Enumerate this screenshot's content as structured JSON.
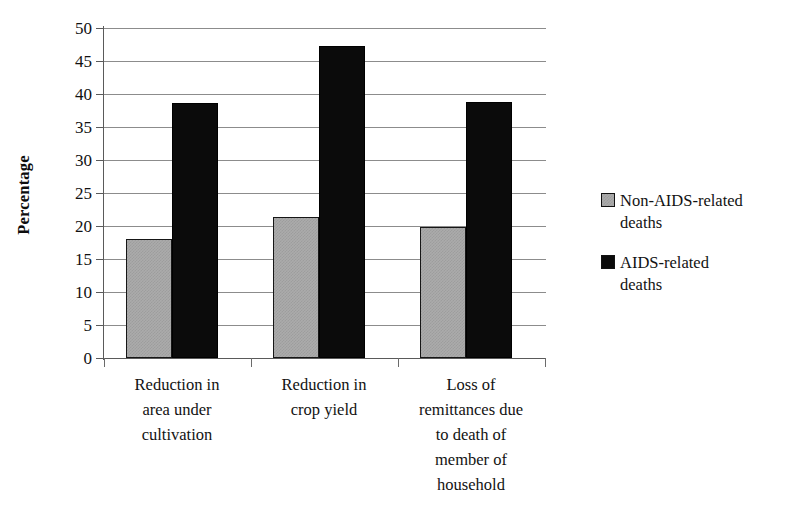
{
  "chart_data": {
    "type": "bar",
    "title": "",
    "xlabel": "",
    "ylabel": "Percentage",
    "ylim": [
      0,
      50
    ],
    "ytick_step": 5,
    "yticks": [
      50,
      45,
      40,
      35,
      30,
      25,
      20,
      15,
      10,
      5,
      0
    ],
    "grid": true,
    "legend_position": "right",
    "categories": [
      "Reduction in area under cultivation",
      "Reduction in crop yield",
      "Loss of remittances due to death of member of household"
    ],
    "category_lines": [
      [
        "Reduction in",
        "area under",
        "cultivation"
      ],
      [
        "Reduction in",
        "crop yield"
      ],
      [
        "Loss of",
        "remittances due",
        "to death of",
        "member of",
        "household"
      ]
    ],
    "series": [
      {
        "name": "Non-AIDS-related deaths",
        "color": "#ababab",
        "legend_lines": [
          "Non-AIDS-related",
          "deaths"
        ],
        "values": [
          18.0,
          21.4,
          19.9
        ]
      },
      {
        "name": "AIDS-related deaths",
        "color": "#0b0b0b",
        "legend_lines": [
          "AIDS-related",
          "deaths"
        ],
        "values": [
          38.6,
          47.3,
          38.8
        ]
      }
    ]
  },
  "axis": {
    "y_title": "Percentage",
    "ticks": [
      {
        "label": "50"
      },
      {
        "label": "45"
      },
      {
        "label": "40"
      },
      {
        "label": "35"
      },
      {
        "label": "30"
      },
      {
        "label": "25"
      },
      {
        "label": "20"
      },
      {
        "label": "15"
      },
      {
        "label": "10"
      },
      {
        "label": "5"
      },
      {
        "label": "0"
      }
    ]
  },
  "categories": [
    {
      "line1": "Reduction in",
      "line2": "area under",
      "line3": "cultivation",
      "line4": "",
      "line5": ""
    },
    {
      "line1": "Reduction in",
      "line2": "crop yield",
      "line3": "",
      "line4": "",
      "line5": ""
    },
    {
      "line1": "Loss of",
      "line2": "remittances due",
      "line3": "to death of",
      "line4": "member of",
      "line5": "household"
    }
  ],
  "legend": [
    {
      "line1": "Non-AIDS-related",
      "line2": "deaths"
    },
    {
      "line1": "AIDS-related",
      "line2": "deaths"
    }
  ]
}
